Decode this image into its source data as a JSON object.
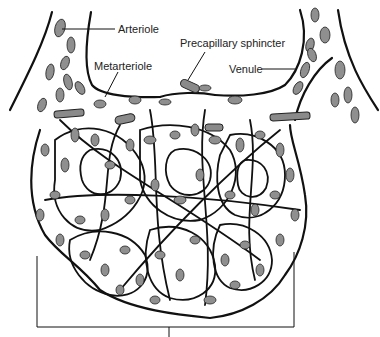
{
  "diagram": {
    "labels": {
      "arteriole": "Arteriole",
      "metarteriole": "Metarteriole",
      "precapillary_sphincter": "Precapillary sphincter",
      "venule": "Venule"
    },
    "colors": {
      "red_blood_cell": "#8f8f8f",
      "vessel_outline": "#111111",
      "sphincter": "#8a8a8a",
      "background": "#ffffff"
    },
    "bracket": {
      "spans": "capillary network",
      "label": ""
    }
  }
}
